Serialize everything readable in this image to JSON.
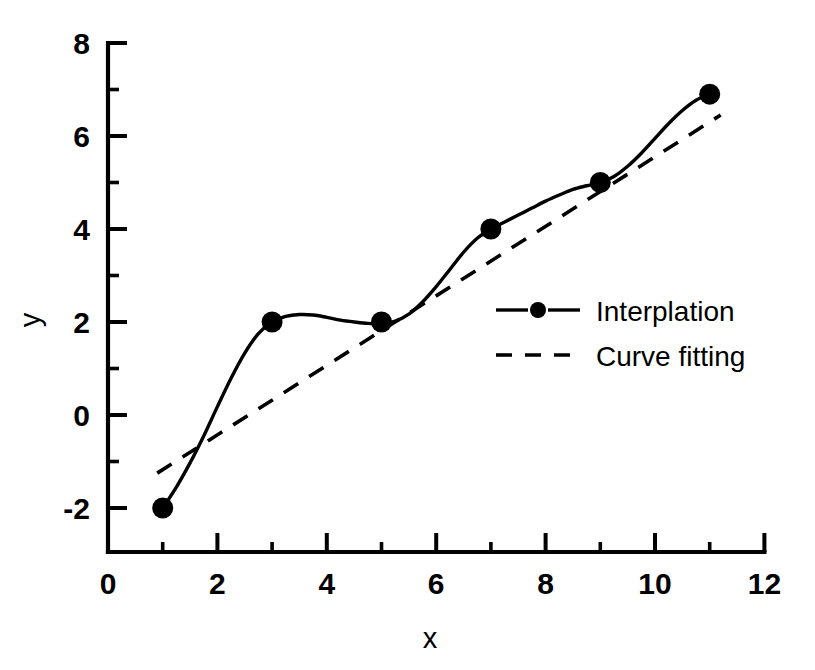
{
  "chart_data": {
    "type": "line",
    "title": "",
    "xlabel": "x",
    "ylabel": "y",
    "xlim": [
      0,
      12
    ],
    "ylim": [
      -3,
      8
    ],
    "xticks": [
      0,
      2,
      4,
      6,
      8,
      10,
      12
    ],
    "xticklabels": [
      "0",
      "2",
      "4",
      "6",
      "8",
      "10",
      "12"
    ],
    "xminorticks": [
      1,
      3,
      5,
      7,
      9,
      11
    ],
    "yticks": [
      -2,
      0,
      2,
      4,
      6,
      8
    ],
    "yticklabels": [
      "-2",
      "0",
      "2",
      "4",
      "6",
      "8"
    ],
    "yminorticks": [
      -1,
      1,
      3,
      5,
      7
    ],
    "grid": false,
    "legend_position": "center-right",
    "series": [
      {
        "name": "Interplation",
        "style": "solid-with-markers",
        "marker": "filled-circle",
        "x": [
          1,
          3,
          5,
          7,
          9,
          11
        ],
        "values": [
          -2,
          2,
          2,
          4,
          5,
          6.9
        ],
        "curve_samples_x": [
          1.0,
          1.25,
          1.5,
          1.75,
          2.0,
          2.25,
          2.5,
          2.75,
          3.0,
          3.25,
          3.5,
          3.75,
          4.0,
          4.25,
          4.5,
          4.75,
          5.0,
          5.25,
          5.5,
          5.75,
          6.0,
          6.25,
          6.5,
          6.75,
          7.0,
          7.25,
          7.5,
          7.75,
          8.0,
          8.25,
          8.5,
          8.75,
          9.0,
          9.25,
          9.5,
          9.75,
          10.0,
          10.25,
          10.5,
          10.75,
          11.0
        ],
        "curve_samples_y": [
          -2.0,
          -1.55,
          -1.03,
          -0.45,
          0.18,
          0.79,
          1.33,
          1.75,
          2.0,
          2.12,
          2.16,
          2.15,
          2.1,
          2.04,
          2.0,
          1.97,
          1.97,
          2.02,
          2.17,
          2.43,
          2.76,
          3.13,
          3.5,
          3.8,
          4.0,
          4.15,
          4.3,
          4.45,
          4.6,
          4.73,
          4.85,
          4.93,
          5.0,
          5.13,
          5.35,
          5.63,
          5.95,
          6.27,
          6.55,
          6.77,
          6.9
        ]
      },
      {
        "name": "Curve fitting",
        "style": "dashed",
        "marker": "none",
        "x": [
          0.9,
          11.2
        ],
        "values": [
          -1.25,
          6.45
        ],
        "fit_description": "straight dashed trend line from (0.9, -1.25) to (11.2, 6.45)"
      }
    ]
  },
  "legend": {
    "items": [
      {
        "label": "Interplation",
        "style": "solid-with-marker"
      },
      {
        "label": "Curve fitting",
        "style": "dashed"
      }
    ]
  },
  "axes": {
    "x_label": "x",
    "y_label": "y"
  },
  "colors": {
    "foreground": "#000000",
    "background": "#ffffff"
  }
}
